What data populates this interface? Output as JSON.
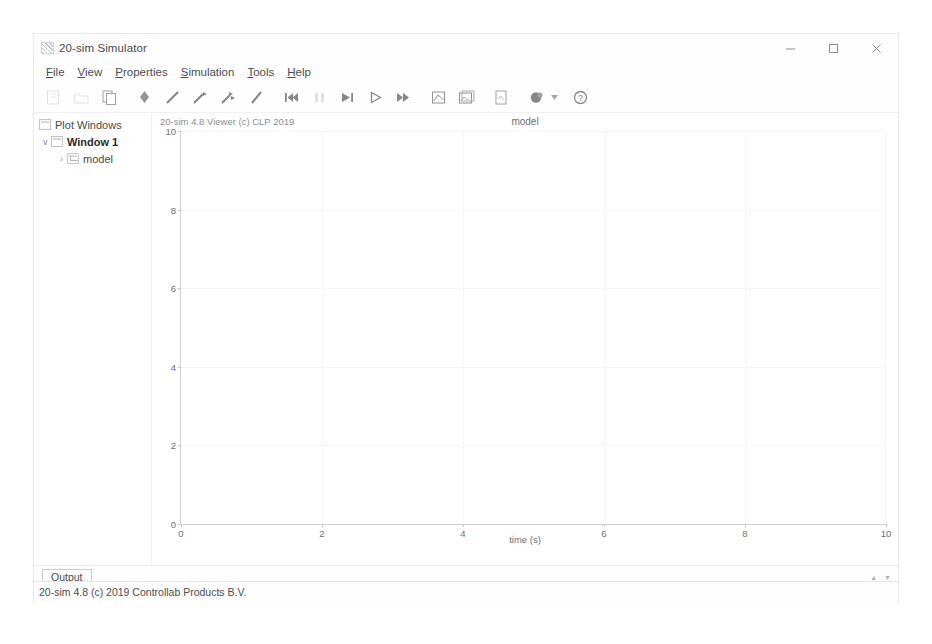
{
  "window": {
    "title": "20-sim Simulator",
    "icon": "app-icon",
    "controls": {
      "minimize": "−",
      "maximize": "□",
      "close": "✕"
    }
  },
  "menubar": {
    "items": [
      {
        "label": "File",
        "mnemonic": "F"
      },
      {
        "label": "View",
        "mnemonic": "V"
      },
      {
        "label": "Properties",
        "mnemonic": "P"
      },
      {
        "label": "Simulation",
        "mnemonic": "S"
      },
      {
        "label": "Tools",
        "mnemonic": "T"
      },
      {
        "label": "Help",
        "mnemonic": "H"
      }
    ]
  },
  "toolbar": {
    "buttons": [
      {
        "name": "new-icon",
        "enabled": false
      },
      {
        "name": "open-icon",
        "enabled": false
      },
      {
        "name": "copy-icon",
        "enabled": true
      },
      {
        "name": "arrow-down-icon",
        "enabled": true
      },
      {
        "name": "pencil-icon",
        "enabled": true
      },
      {
        "name": "pencil-arrow-icon",
        "enabled": true
      },
      {
        "name": "pencil-double-arrow-icon",
        "enabled": true
      },
      {
        "name": "line-icon",
        "enabled": true
      },
      {
        "name": "rewind-to-start-icon",
        "enabled": true
      },
      {
        "name": "pause-icon",
        "enabled": false
      },
      {
        "name": "step-forward-icon",
        "enabled": true
      },
      {
        "name": "run-icon",
        "enabled": true
      },
      {
        "name": "fast-forward-icon",
        "enabled": true
      },
      {
        "name": "plot-properties-icon",
        "enabled": true
      },
      {
        "name": "multiple-plots-icon",
        "enabled": true
      },
      {
        "name": "copy-plot-icon",
        "enabled": true
      },
      {
        "name": "globe-icon",
        "enabled": true
      },
      {
        "name": "help-icon",
        "enabled": true
      }
    ]
  },
  "tree": {
    "root_label": "Plot Windows",
    "nodes": [
      {
        "label": "Window 1",
        "selected": true,
        "expanded": true,
        "expander": "∨",
        "children": [
          {
            "label": "model",
            "selected": false,
            "expanded": false,
            "expander": "›"
          }
        ]
      }
    ]
  },
  "plot": {
    "viewer_note": "20-sim 4.8 Viewer (c) CLP 2019"
  },
  "chart_data": {
    "type": "line",
    "title": "model",
    "xlabel": "time (s)",
    "ylabel": "",
    "xlim": [
      0,
      10
    ],
    "ylim": [
      0,
      10
    ],
    "xticks": [
      "0",
      "2",
      "4",
      "6",
      "8",
      "10"
    ],
    "xtick_values": [
      0,
      2,
      4,
      6,
      8,
      10
    ],
    "yticks": [
      "0",
      "2",
      "4",
      "6",
      "8",
      "10"
    ],
    "ytick_values": [
      0,
      2,
      4,
      6,
      8,
      10
    ],
    "grid": true,
    "legend": null,
    "series": []
  },
  "output": {
    "tab_label": "Output",
    "scroll_up": "▲",
    "scroll_down": "▼",
    "text": ""
  },
  "statusbar": {
    "text": "20-sim 4.8 (c) 2019 Controllab Products B.V."
  }
}
